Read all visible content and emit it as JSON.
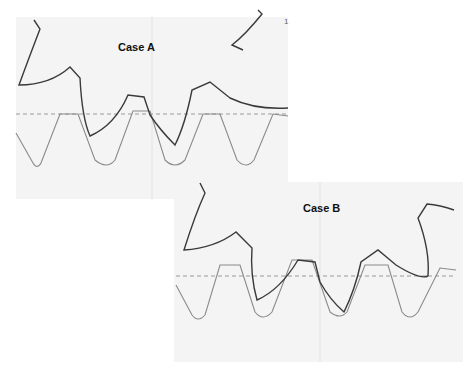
{
  "diagram": {
    "type": "gear-tooth-profile-comparison",
    "panels": [
      {
        "id": "case-a",
        "label": "Case A"
      },
      {
        "id": "case-b",
        "label": "Case B"
      }
    ],
    "corner_mark": "1",
    "colors": {
      "cutter_profile": "#3a3a3a",
      "rack_profile": "#8a8a8a",
      "pitch_line": "#9a9a9a",
      "panel_background": "#f4f4f4"
    }
  }
}
